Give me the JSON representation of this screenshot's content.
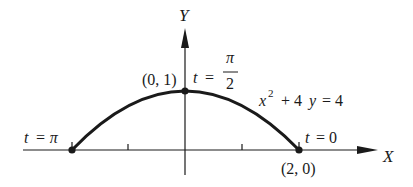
{
  "figure": {
    "axes": {
      "x_label": "X",
      "y_label": "Y"
    },
    "curve": {
      "equation_x": "x",
      "equation_exp": "2",
      "equation_rest": "+ 4",
      "equation_y": "y",
      "equation_end": "= 4"
    },
    "points": [
      {
        "label": "(0, 1)",
        "param_t": "t",
        "param_eq": "=",
        "param_num": "π",
        "param_den": "2"
      },
      {
        "label": "(2, 0)",
        "param_t": "t",
        "param_eq": "= 0"
      },
      {
        "label": "",
        "param_t": "t",
        "param_eq": "= π"
      }
    ],
    "colors": {
      "ink": "#1a1a1a",
      "background": "#ffffff"
    }
  }
}
